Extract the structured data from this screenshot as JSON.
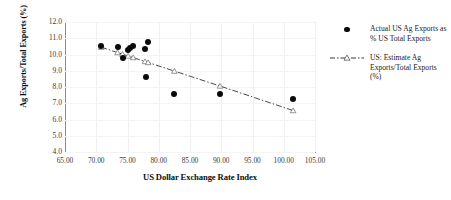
{
  "chart_data": {
    "type": "scatter",
    "title": "",
    "xlabel": "US Dollar Exchange Rate Index",
    "ylabel": "Ag Exports/Total Exports (%)",
    "xlim": [
      65.0,
      105.0
    ],
    "ylim": [
      4.0,
      12.0
    ],
    "xticks": [
      "65.00",
      "70.00",
      "75.00",
      "80.00",
      "85.00",
      "90.00",
      "95.00",
      "100.00",
      "105.00"
    ],
    "yticks": [
      "4.0",
      "5.0",
      "6.0",
      "7.0",
      "8.0",
      "9.0",
      "10.0",
      "11.0",
      "12.0"
    ],
    "grid": true,
    "legend_position": "right",
    "series": [
      {
        "name": "Actual US Ag Exports as % US Total Exports",
        "marker": "filled-circle",
        "color": "#0a0a0a",
        "points": [
          {
            "x": 70.8,
            "y": 10.5
          },
          {
            "x": 73.4,
            "y": 10.45
          },
          {
            "x": 74.2,
            "y": 9.8
          },
          {
            "x": 75.1,
            "y": 10.3
          },
          {
            "x": 75.4,
            "y": 10.4
          },
          {
            "x": 75.9,
            "y": 10.5
          },
          {
            "x": 77.8,
            "y": 10.35
          },
          {
            "x": 78.3,
            "y": 10.75
          },
          {
            "x": 78.0,
            "y": 8.6
          },
          {
            "x": 82.5,
            "y": 7.6
          },
          {
            "x": 89.8,
            "y": 7.55
          },
          {
            "x": 101.5,
            "y": 7.25
          }
        ]
      },
      {
        "name": "US: Estimate Ag Exports/Total Exports (%)",
        "marker": "open-triangle",
        "line": "dash-dot",
        "color": "#4a4a4a",
        "points": [
          {
            "x": 70.8,
            "y": 10.45
          },
          {
            "x": 73.4,
            "y": 10.12
          },
          {
            "x": 74.2,
            "y": 10.02
          },
          {
            "x": 75.1,
            "y": 9.91
          },
          {
            "x": 75.9,
            "y": 9.81
          },
          {
            "x": 77.8,
            "y": 9.57
          },
          {
            "x": 78.3,
            "y": 9.51
          },
          {
            "x": 82.5,
            "y": 8.98
          },
          {
            "x": 89.8,
            "y": 8.06
          },
          {
            "x": 101.5,
            "y": 6.55
          }
        ]
      }
    ]
  },
  "legend": {
    "items": [
      {
        "label": "Actual US Ag Exports as % US Total Exports",
        "marker": "filled-circle"
      },
      {
        "label": "US: Estimate Ag Exports/Total Exports (%)",
        "marker": "dash-dot-triangle"
      }
    ]
  }
}
